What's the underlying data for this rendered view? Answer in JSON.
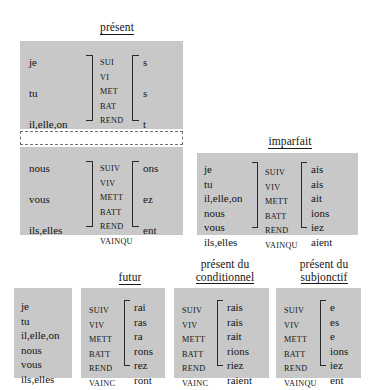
{
  "document": {
    "title": "Conjugaison - terminaisons des verbes"
  },
  "sections": {
    "present": {
      "heading": "présent",
      "singular": {
        "pronouns": [
          "je",
          "tu",
          "il,elle,on"
        ],
        "stems": [
          "SUI",
          "VI",
          "MET",
          "BAT",
          "REND",
          "VAINC"
        ],
        "endings": [
          "s",
          "s",
          "t"
        ]
      },
      "plural": {
        "pronouns": [
          "nous",
          "vous",
          "ils,elles"
        ],
        "stems": [
          "SUIV",
          "VIV",
          "METT",
          "BATT",
          "REND",
          "VAINQU"
        ],
        "endings": [
          "ons",
          "ez",
          "ent"
        ]
      }
    },
    "imparfait": {
      "heading": "imparfait",
      "pronouns": [
        "je",
        "tu",
        "il,elle,on",
        "nous",
        "vous",
        "ils,elles"
      ],
      "stems": [
        "SUIV",
        "VIV",
        "METT",
        "BATT",
        "REND",
        "VAINQU"
      ],
      "endings": [
        "ais",
        "ais",
        "ait",
        "ions",
        "iez",
        "aient"
      ]
    },
    "shared_pronouns": {
      "pronouns": [
        "je",
        "tu",
        "il,elle,on",
        "nous",
        "vous",
        "ils,elles"
      ]
    },
    "futur": {
      "heading": "futur",
      "stems": [
        "SUIV",
        "VIV",
        "METT",
        "BATT",
        "REND",
        "VAINC"
      ],
      "endings": [
        "rai",
        "ras",
        "ra",
        "rons",
        "rez",
        "ront"
      ]
    },
    "conditionnel": {
      "heading_line1": "présent du",
      "heading_line2": "conditionnel",
      "stems": [
        "SUIV",
        "VIV",
        "METT",
        "BATT",
        "REND",
        "VAINC"
      ],
      "endings": [
        "rais",
        "rais",
        "rait",
        "rions",
        "riez",
        "raient"
      ]
    },
    "subjonctif": {
      "heading_line1": "présent du",
      "heading_line2": "subjonctif",
      "stems": [
        "SUIV",
        "VIV",
        "METT",
        "BATT",
        "REND",
        "VAINQU"
      ],
      "endings": [
        "e",
        "es",
        "e",
        "ions",
        "iez",
        "ent"
      ]
    }
  },
  "colors": {
    "panel": "#c8c8c8",
    "background": "#ffffff",
    "text": "#141414"
  }
}
